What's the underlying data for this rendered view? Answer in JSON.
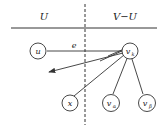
{
  "regions": {
    "left_label": "U",
    "right_label": "V−U"
  },
  "nodes": {
    "u": "u",
    "vk": "v",
    "vk_sub": "k",
    "x": "x",
    "va": "v",
    "va_sub": "α",
    "vb": "v",
    "vb_sub": "β"
  },
  "edges": {
    "e_label": "e"
  },
  "colors": {
    "stroke": "#333333",
    "background": "#ffffff"
  }
}
